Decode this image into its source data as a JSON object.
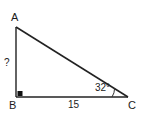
{
  "figure": {
    "kind": "geometry-diagram",
    "shape": "right-triangle",
    "background_color": "#ffffff",
    "stroke_color": "#222222",
    "text_color": "#1c1c1c"
  },
  "vertices": {
    "a": {
      "label": "A",
      "x": 15,
      "y": 27
    },
    "b": {
      "label": "B",
      "x": 16,
      "y": 97
    },
    "c": {
      "label": "C",
      "x": 128,
      "y": 97
    }
  },
  "sides": {
    "ab": {
      "label": "?",
      "known": false
    },
    "bc": {
      "label": "15",
      "known": true
    },
    "ac": {
      "label": "",
      "known": false
    }
  },
  "angles": {
    "at_c": {
      "label": "32°",
      "value": 32,
      "unit": "degrees"
    },
    "at_b": {
      "label": "",
      "value": 90,
      "unit": "degrees",
      "marker": "right-angle-square"
    }
  },
  "markers": {
    "right_angle": {
      "name": "right-angle-square",
      "x": 18,
      "y": 91,
      "size": 5
    },
    "angle_arc": {
      "name": "angle-arc-c",
      "radius": 16
    }
  }
}
